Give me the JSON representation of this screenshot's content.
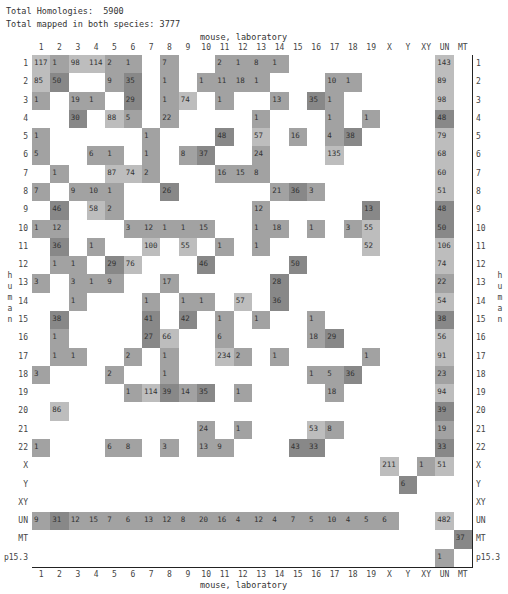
{
  "header": {
    "total_homologies_label": "Total Homologies:  5900",
    "total_mapped_label": "Total mapped in both species: 3777"
  },
  "axes": {
    "x_title": "mouse, laboratory",
    "y_title": "human"
  },
  "chart_data": {
    "type": "heatmap",
    "xlabel": "mouse, laboratory",
    "ylabel": "human",
    "columns": [
      "1",
      "2",
      "3",
      "4",
      "5",
      "6",
      "7",
      "8",
      "9",
      "10",
      "11",
      "12",
      "13",
      "14",
      "15",
      "16",
      "17",
      "18",
      "19",
      "X",
      "Y",
      "XY",
      "UN",
      "MT"
    ],
    "rows": [
      "1",
      "2",
      "3",
      "4",
      "5",
      "6",
      "7",
      "8",
      "9",
      "10",
      "11",
      "12",
      "13",
      "14",
      "15",
      "16",
      "17",
      "18",
      "19",
      "20",
      "21",
      "22",
      "X",
      "Y",
      "XY",
      "UN",
      "MT",
      "p15.3"
    ],
    "cells": [
      {
        "r": "1",
        "c": "1",
        "v": 117,
        "s": 1
      },
      {
        "r": "1",
        "c": "2",
        "v": 1,
        "s": 2
      },
      {
        "r": "1",
        "c": "3",
        "v": 98,
        "s": 1
      },
      {
        "r": "1",
        "c": "4",
        "v": 114,
        "s": 1
      },
      {
        "r": "1",
        "c": "5",
        "v": 2,
        "s": 2
      },
      {
        "r": "1",
        "c": "6",
        "v": 1,
        "s": 2
      },
      {
        "r": "1",
        "c": "8",
        "v": 7,
        "s": 2
      },
      {
        "r": "1",
        "c": "11",
        "v": 2,
        "s": 2
      },
      {
        "r": "1",
        "c": "12",
        "v": 1,
        "s": 2
      },
      {
        "r": "1",
        "c": "13",
        "v": 8,
        "s": 2
      },
      {
        "r": "1",
        "c": "14",
        "v": 1,
        "s": 2
      },
      {
        "r": "1",
        "c": "UN",
        "v": 143,
        "s": 1
      },
      {
        "r": "2",
        "c": "1",
        "v": 85,
        "s": 1
      },
      {
        "r": "2",
        "c": "2",
        "v": 50,
        "s": 3
      },
      {
        "r": "2",
        "c": "5",
        "v": 9,
        "s": 2
      },
      {
        "r": "2",
        "c": "6",
        "v": 35,
        "s": 3
      },
      {
        "r": "2",
        "c": "8",
        "v": 1,
        "s": 2
      },
      {
        "r": "2",
        "c": "10",
        "v": 1,
        "s": 2
      },
      {
        "r": "2",
        "c": "11",
        "v": 11,
        "s": 2
      },
      {
        "r": "2",
        "c": "12",
        "v": 18,
        "s": 2
      },
      {
        "r": "2",
        "c": "13",
        "v": 1,
        "s": 2
      },
      {
        "r": "2",
        "c": "17",
        "v": 10,
        "s": 2
      },
      {
        "r": "2",
        "c": "18",
        "v": 1,
        "s": 2
      },
      {
        "r": "2",
        "c": "UN",
        "v": 89,
        "s": 1
      },
      {
        "r": "3",
        "c": "1",
        "v": 1,
        "s": 2
      },
      {
        "r": "3",
        "c": "3",
        "v": 19,
        "s": 2
      },
      {
        "r": "3",
        "c": "4",
        "v": 1,
        "s": 2
      },
      {
        "r": "3",
        "c": "6",
        "v": 29,
        "s": 3
      },
      {
        "r": "3",
        "c": "8",
        "v": 1,
        "s": 2
      },
      {
        "r": "3",
        "c": "9",
        "v": 74,
        "s": 1
      },
      {
        "r": "3",
        "c": "11",
        "v": 1,
        "s": 2
      },
      {
        "r": "3",
        "c": "14",
        "v": 13,
        "s": 2
      },
      {
        "r": "3",
        "c": "16",
        "v": 35,
        "s": 3
      },
      {
        "r": "3",
        "c": "17",
        "v": 1,
        "s": 2
      },
      {
        "r": "3",
        "c": "UN",
        "v": 98,
        "s": 1
      },
      {
        "r": "4",
        "c": "3",
        "v": 30,
        "s": 3
      },
      {
        "r": "4",
        "c": "5",
        "v": 88,
        "s": 1
      },
      {
        "r": "4",
        "c": "6",
        "v": 5,
        "s": 2
      },
      {
        "r": "4",
        "c": "8",
        "v": 22,
        "s": 2
      },
      {
        "r": "4",
        "c": "13",
        "v": 1,
        "s": 2
      },
      {
        "r": "4",
        "c": "17",
        "v": 1,
        "s": 2
      },
      {
        "r": "4",
        "c": "19",
        "v": 1,
        "s": 2
      },
      {
        "r": "4",
        "c": "UN",
        "v": 48,
        "s": 3
      },
      {
        "r": "5",
        "c": "1",
        "v": 1,
        "s": 2
      },
      {
        "r": "5",
        "c": "7",
        "v": 1,
        "s": 2
      },
      {
        "r": "5",
        "c": "11",
        "v": 48,
        "s": 3
      },
      {
        "r": "5",
        "c": "13",
        "v": 57,
        "s": 1
      },
      {
        "r": "5",
        "c": "15",
        "v": 16,
        "s": 2
      },
      {
        "r": "5",
        "c": "17",
        "v": 4,
        "s": 2
      },
      {
        "r": "5",
        "c": "18",
        "v": 38,
        "s": 3
      },
      {
        "r": "5",
        "c": "UN",
        "v": 79,
        "s": 1
      },
      {
        "r": "6",
        "c": "1",
        "v": 5,
        "s": 2
      },
      {
        "r": "6",
        "c": "4",
        "v": 6,
        "s": 2
      },
      {
        "r": "6",
        "c": "5",
        "v": 1,
        "s": 2
      },
      {
        "r": "6",
        "c": "7",
        "v": 1,
        "s": 2
      },
      {
        "r": "6",
        "c": "9",
        "v": 8,
        "s": 2
      },
      {
        "r": "6",
        "c": "10",
        "v": 37,
        "s": 3
      },
      {
        "r": "6",
        "c": "13",
        "v": 24,
        "s": 2
      },
      {
        "r": "6",
        "c": "17",
        "v": 135,
        "s": 1
      },
      {
        "r": "6",
        "c": "UN",
        "v": 68,
        "s": 1
      },
      {
        "r": "7",
        "c": "2",
        "v": 1,
        "s": 2
      },
      {
        "r": "7",
        "c": "5",
        "v": 87,
        "s": 1
      },
      {
        "r": "7",
        "c": "6",
        "v": 74,
        "s": 1
      },
      {
        "r": "7",
        "c": "7",
        "v": 2,
        "s": 2
      },
      {
        "r": "7",
        "c": "11",
        "v": 16,
        "s": 2
      },
      {
        "r": "7",
        "c": "12",
        "v": 15,
        "s": 2
      },
      {
        "r": "7",
        "c": "13",
        "v": 8,
        "s": 2
      },
      {
        "r": "7",
        "c": "UN",
        "v": 60,
        "s": 1
      },
      {
        "r": "8",
        "c": "1",
        "v": 7,
        "s": 2
      },
      {
        "r": "8",
        "c": "3",
        "v": 9,
        "s": 2
      },
      {
        "r": "8",
        "c": "4",
        "v": 10,
        "s": 2
      },
      {
        "r": "8",
        "c": "5",
        "v": 1,
        "s": 2
      },
      {
        "r": "8",
        "c": "8",
        "v": 26,
        "s": 3
      },
      {
        "r": "8",
        "c": "14",
        "v": 21,
        "s": 2
      },
      {
        "r": "8",
        "c": "15",
        "v": 36,
        "s": 3
      },
      {
        "r": "8",
        "c": "16",
        "v": 3,
        "s": 2
      },
      {
        "r": "8",
        "c": "UN",
        "v": 51,
        "s": 1
      },
      {
        "r": "9",
        "c": "2",
        "v": 46,
        "s": 3
      },
      {
        "r": "9",
        "c": "4",
        "v": 58,
        "s": 1
      },
      {
        "r": "9",
        "c": "5",
        "v": 2,
        "s": 2
      },
      {
        "r": "9",
        "c": "13",
        "v": 12,
        "s": 2
      },
      {
        "r": "9",
        "c": "19",
        "v": 13,
        "s": 3
      },
      {
        "r": "9",
        "c": "UN",
        "v": 48,
        "s": 3
      },
      {
        "r": "10",
        "c": "1",
        "v": 1,
        "s": 2
      },
      {
        "r": "10",
        "c": "2",
        "v": 12,
        "s": 2
      },
      {
        "r": "10",
        "c": "6",
        "v": 3,
        "s": 2
      },
      {
        "r": "10",
        "c": "7",
        "v": 12,
        "s": 2
      },
      {
        "r": "10",
        "c": "8",
        "v": 1,
        "s": 2
      },
      {
        "r": "10",
        "c": "9",
        "v": 1,
        "s": 2
      },
      {
        "r": "10",
        "c": "10",
        "v": 15,
        "s": 2
      },
      {
        "r": "10",
        "c": "13",
        "v": 1,
        "s": 2
      },
      {
        "r": "10",
        "c": "14",
        "v": 18,
        "s": 2
      },
      {
        "r": "10",
        "c": "16",
        "v": 1,
        "s": 2
      },
      {
        "r": "10",
        "c": "18",
        "v": 3,
        "s": 2
      },
      {
        "r": "10",
        "c": "19",
        "v": 55,
        "s": 1
      },
      {
        "r": "10",
        "c": "UN",
        "v": 50,
        "s": 3
      },
      {
        "r": "11",
        "c": "2",
        "v": 36,
        "s": 3
      },
      {
        "r": "11",
        "c": "4",
        "v": 1,
        "s": 2
      },
      {
        "r": "11",
        "c": "7",
        "v": 100,
        "s": 1
      },
      {
        "r": "11",
        "c": "9",
        "v": 55,
        "s": 1
      },
      {
        "r": "11",
        "c": "11",
        "v": 1,
        "s": 2
      },
      {
        "r": "11",
        "c": "13",
        "v": 1,
        "s": 2
      },
      {
        "r": "11",
        "c": "19",
        "v": 52,
        "s": 1
      },
      {
        "r": "11",
        "c": "UN",
        "v": 106,
        "s": 1
      },
      {
        "r": "12",
        "c": "2",
        "v": 1,
        "s": 2
      },
      {
        "r": "12",
        "c": "3",
        "v": 1,
        "s": 2
      },
      {
        "r": "12",
        "c": "5",
        "v": 29,
        "s": 3
      },
      {
        "r": "12",
        "c": "6",
        "v": 76,
        "s": 1
      },
      {
        "r": "12",
        "c": "10",
        "v": 46,
        "s": 3
      },
      {
        "r": "12",
        "c": "15",
        "v": 50,
        "s": 3
      },
      {
        "r": "12",
        "c": "UN",
        "v": 74,
        "s": 1
      },
      {
        "r": "13",
        "c": "1",
        "v": 3,
        "s": 2
      },
      {
        "r": "13",
        "c": "3",
        "v": 3,
        "s": 2
      },
      {
        "r": "13",
        "c": "4",
        "v": 1,
        "s": 2
      },
      {
        "r": "13",
        "c": "5",
        "v": 9,
        "s": 2
      },
      {
        "r": "13",
        "c": "8",
        "v": 17,
        "s": 2
      },
      {
        "r": "13",
        "c": "14",
        "v": 28,
        "s": 3
      },
      {
        "r": "13",
        "c": "UN",
        "v": 22,
        "s": 2
      },
      {
        "r": "14",
        "c": "3",
        "v": 1,
        "s": 2
      },
      {
        "r": "14",
        "c": "7",
        "v": 1,
        "s": 2
      },
      {
        "r": "14",
        "c": "9",
        "v": 1,
        "s": 2
      },
      {
        "r": "14",
        "c": "10",
        "v": 1,
        "s": 2
      },
      {
        "r": "14",
        "c": "12",
        "v": 57,
        "s": 1
      },
      {
        "r": "14",
        "c": "14",
        "v": 36,
        "s": 3
      },
      {
        "r": "14",
        "c": "UN",
        "v": 54,
        "s": 1
      },
      {
        "r": "15",
        "c": "2",
        "v": 38,
        "s": 3
      },
      {
        "r": "15",
        "c": "7",
        "v": 41,
        "s": 3
      },
      {
        "r": "15",
        "c": "9",
        "v": 42,
        "s": 3
      },
      {
        "r": "15",
        "c": "11",
        "v": 1,
        "s": 2
      },
      {
        "r": "15",
        "c": "13",
        "v": 1,
        "s": 2
      },
      {
        "r": "15",
        "c": "16",
        "v": 1,
        "s": 2
      },
      {
        "r": "15",
        "c": "UN",
        "v": 38,
        "s": 3
      },
      {
        "r": "16",
        "c": "2",
        "v": 1,
        "s": 2
      },
      {
        "r": "16",
        "c": "7",
        "v": 27,
        "s": 3
      },
      {
        "r": "16",
        "c": "8",
        "v": 66,
        "s": 1
      },
      {
        "r": "16",
        "c": "11",
        "v": 6,
        "s": 2
      },
      {
        "r": "16",
        "c": "16",
        "v": 18,
        "s": 2
      },
      {
        "r": "16",
        "c": "17",
        "v": 29,
        "s": 3
      },
      {
        "r": "16",
        "c": "UN",
        "v": 56,
        "s": 1
      },
      {
        "r": "17",
        "c": "2",
        "v": 1,
        "s": 2
      },
      {
        "r": "17",
        "c": "3",
        "v": 1,
        "s": 2
      },
      {
        "r": "17",
        "c": "6",
        "v": 2,
        "s": 2
      },
      {
        "r": "17",
        "c": "8",
        "v": 1,
        "s": 2
      },
      {
        "r": "17",
        "c": "11",
        "v": 234,
        "s": 1
      },
      {
        "r": "17",
        "c": "12",
        "v": 2,
        "s": 2
      },
      {
        "r": "17",
        "c": "14",
        "v": 1,
        "s": 2
      },
      {
        "r": "17",
        "c": "19",
        "v": 1,
        "s": 2
      },
      {
        "r": "17",
        "c": "UN",
        "v": 91,
        "s": 1
      },
      {
        "r": "18",
        "c": "1",
        "v": 3,
        "s": 2
      },
      {
        "r": "18",
        "c": "5",
        "v": 2,
        "s": 2
      },
      {
        "r": "18",
        "c": "8",
        "v": 1,
        "s": 2
      },
      {
        "r": "18",
        "c": "16",
        "v": 1,
        "s": 2
      },
      {
        "r": "18",
        "c": "17",
        "v": 5,
        "s": 2
      },
      {
        "r": "18",
        "c": "18",
        "v": 36,
        "s": 3
      },
      {
        "r": "18",
        "c": "UN",
        "v": 23,
        "s": 2
      },
      {
        "r": "19",
        "c": "6",
        "v": 1,
        "s": 2
      },
      {
        "r": "19",
        "c": "7",
        "v": 114,
        "s": 1
      },
      {
        "r": "19",
        "c": "8",
        "v": 39,
        "s": 3
      },
      {
        "r": "19",
        "c": "9",
        "v": 14,
        "s": 2
      },
      {
        "r": "19",
        "c": "10",
        "v": 35,
        "s": 3
      },
      {
        "r": "19",
        "c": "12",
        "v": 1,
        "s": 2
      },
      {
        "r": "19",
        "c": "17",
        "v": 18,
        "s": 2
      },
      {
        "r": "19",
        "c": "UN",
        "v": 94,
        "s": 1
      },
      {
        "r": "20",
        "c": "2",
        "v": 86,
        "s": 1
      },
      {
        "r": "20",
        "c": "UN",
        "v": 39,
        "s": 3
      },
      {
        "r": "21",
        "c": "10",
        "v": 24,
        "s": 2
      },
      {
        "r": "21",
        "c": "12",
        "v": 1,
        "s": 2
      },
      {
        "r": "21",
        "c": "16",
        "v": 53,
        "s": 1
      },
      {
        "r": "21",
        "c": "17",
        "v": 8,
        "s": 2
      },
      {
        "r": "21",
        "c": "UN",
        "v": 19,
        "s": 2
      },
      {
        "r": "22",
        "c": "1",
        "v": 1,
        "s": 2
      },
      {
        "r": "22",
        "c": "5",
        "v": 6,
        "s": 2
      },
      {
        "r": "22",
        "c": "6",
        "v": 8,
        "s": 2
      },
      {
        "r": "22",
        "c": "8",
        "v": 3,
        "s": 2
      },
      {
        "r": "22",
        "c": "10",
        "v": 13,
        "s": 2
      },
      {
        "r": "22",
        "c": "11",
        "v": 9,
        "s": 2
      },
      {
        "r": "22",
        "c": "15",
        "v": 43,
        "s": 3
      },
      {
        "r": "22",
        "c": "16",
        "v": 33,
        "s": 3
      },
      {
        "r": "22",
        "c": "UN",
        "v": 33,
        "s": 3
      },
      {
        "r": "X",
        "c": "X",
        "v": 211,
        "s": 1
      },
      {
        "r": "X",
        "c": "XY",
        "v": 1,
        "s": 2
      },
      {
        "r": "X",
        "c": "UN",
        "v": 51,
        "s": 1
      },
      {
        "r": "Y",
        "c": "Y",
        "v": 6,
        "s": 3
      },
      {
        "r": "UN",
        "c": "1",
        "v": 9,
        "s": 2
      },
      {
        "r": "UN",
        "c": "2",
        "v": 31,
        "s": 3
      },
      {
        "r": "UN",
        "c": "3",
        "v": 12,
        "s": 2
      },
      {
        "r": "UN",
        "c": "4",
        "v": 15,
        "s": 2
      },
      {
        "r": "UN",
        "c": "5",
        "v": 7,
        "s": 2
      },
      {
        "r": "UN",
        "c": "6",
        "v": 6,
        "s": 2
      },
      {
        "r": "UN",
        "c": "7",
        "v": 13,
        "s": 2
      },
      {
        "r": "UN",
        "c": "8",
        "v": 12,
        "s": 2
      },
      {
        "r": "UN",
        "c": "9",
        "v": 8,
        "s": 2
      },
      {
        "r": "UN",
        "c": "10",
        "v": 20,
        "s": 2
      },
      {
        "r": "UN",
        "c": "11",
        "v": 16,
        "s": 2
      },
      {
        "r": "UN",
        "c": "12",
        "v": 4,
        "s": 2
      },
      {
        "r": "UN",
        "c": "13",
        "v": 12,
        "s": 2
      },
      {
        "r": "UN",
        "c": "14",
        "v": 4,
        "s": 2
      },
      {
        "r": "UN",
        "c": "15",
        "v": 7,
        "s": 2
      },
      {
        "r": "UN",
        "c": "16",
        "v": 5,
        "s": 2
      },
      {
        "r": "UN",
        "c": "17",
        "v": 10,
        "s": 2
      },
      {
        "r": "UN",
        "c": "18",
        "v": 4,
        "s": 2
      },
      {
        "r": "UN",
        "c": "19",
        "v": 5,
        "s": 2
      },
      {
        "r": "UN",
        "c": "X",
        "v": 6,
        "s": 2
      },
      {
        "r": "UN",
        "c": "UN",
        "v": 482,
        "s": 1
      },
      {
        "r": "MT",
        "c": "MT",
        "v": 37,
        "s": 3
      },
      {
        "r": "p15.3",
        "c": "UN",
        "v": 1,
        "s": 2
      }
    ],
    "shade_colors": {
      "0": "#ffffff",
      "1": "#bdbdbd",
      "2": "#a2a2a2",
      "3": "#888888"
    },
    "legend": "none",
    "grid": true
  }
}
